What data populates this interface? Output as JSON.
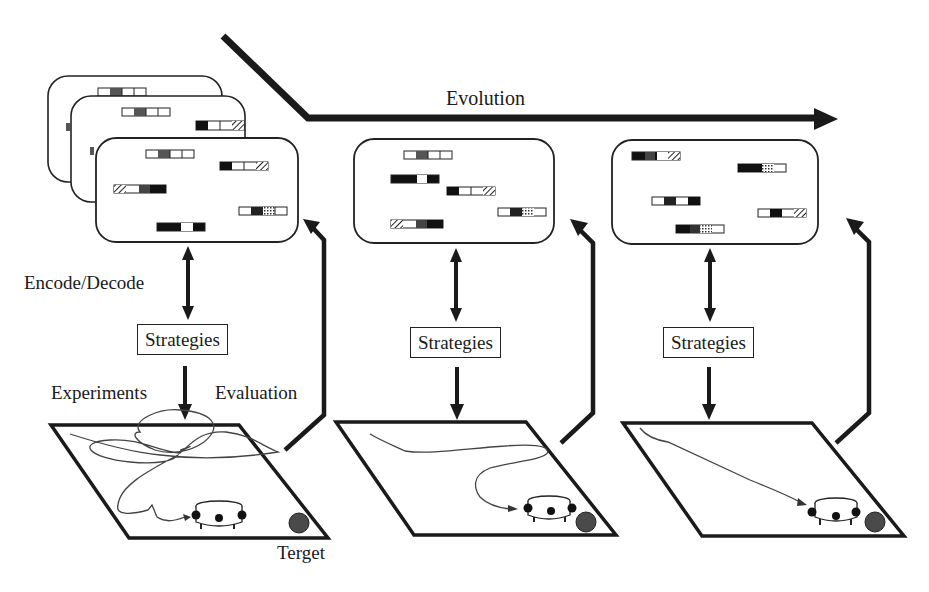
{
  "diagram": {
    "evolution_label": "Evolution",
    "labels": {
      "encode_decode": "Encode/Decode",
      "experiments": "Experiments",
      "evaluation": "Evaluation",
      "target": "Terget"
    },
    "stages": [
      {
        "strategies_label": "Strategies",
        "path_type": "tangled",
        "population_stacked": true
      },
      {
        "strategies_label": "Strategies",
        "path_type": "curved",
        "population_stacked": false
      },
      {
        "strategies_label": "Strategies",
        "path_type": "direct",
        "population_stacked": false
      }
    ],
    "colors": {
      "stroke": "#1a1a1a",
      "path": "#555555",
      "target": "#4a4a4a",
      "gene_dark": "#111111",
      "gene_mid": "#555555"
    }
  }
}
